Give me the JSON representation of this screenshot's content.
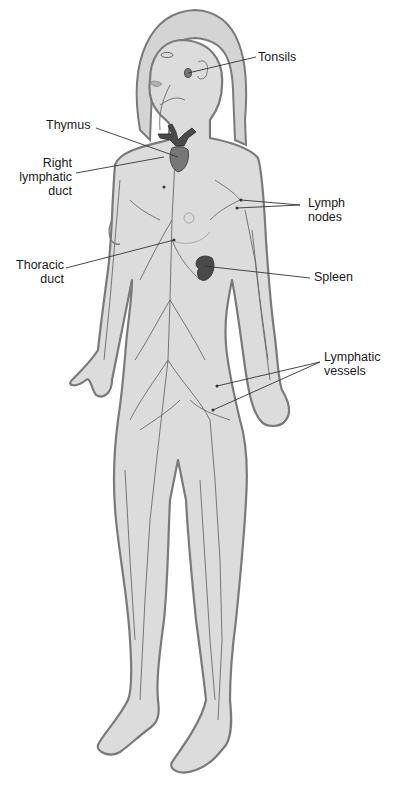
{
  "diagram": {
    "colors": {
      "background": "#ffffff",
      "body_fill": "#dcdcdc",
      "body_outline": "#7a7a7a",
      "vessel_stroke": "#6a6a6a",
      "organ_fill_dark": "#4a4a4a",
      "organ_fill_medium": "#777777",
      "label_text": "#1a1a1a",
      "leader_line": "#333333"
    },
    "labels": {
      "tonsils": "Tonsils",
      "thymus": "Thymus",
      "right_lymphatic_duct": "Right\nlymphatic\nduct",
      "lymph_nodes": "Lymph\nnodes",
      "thoracic_duct": "Thoracic\nduct",
      "spleen": "Spleen",
      "lymphatic_vessels": "Lymphatic\nvessels"
    }
  }
}
